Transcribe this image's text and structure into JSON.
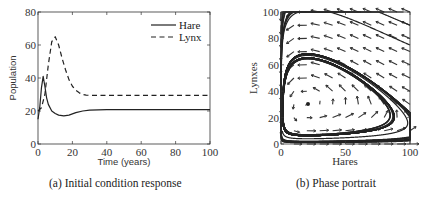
{
  "chart_data": [
    {
      "type": "line",
      "title": "",
      "caption": "(a) Initial condition response",
      "xlabel": "Time (years)",
      "ylabel": "Population",
      "xlim": [
        0,
        100
      ],
      "ylim": [
        0,
        80
      ],
      "xticks": [
        "0",
        "20",
        "40",
        "60",
        "80",
        "100"
      ],
      "yticks": [
        "0",
        "20",
        "40",
        "60",
        "80"
      ],
      "grid": false,
      "legend_position": "upper right",
      "series": [
        {
          "name": "Hare",
          "style": "solid",
          "x": [
            0,
            1,
            2,
            3,
            4,
            5,
            6,
            8,
            10,
            12,
            15,
            18,
            22,
            26,
            30,
            40,
            60,
            80,
            100
          ],
          "values": [
            15,
            22,
            34,
            41,
            35,
            28,
            24,
            20,
            18.5,
            17.5,
            17,
            17.5,
            19,
            20,
            20.5,
            20.8,
            20.8,
            20.8,
            20.8
          ]
        },
        {
          "name": "Lynx",
          "style": "dashed",
          "x": [
            0,
            2,
            4,
            6,
            8,
            10,
            12,
            14,
            16,
            18,
            20,
            22,
            24,
            26,
            28,
            30,
            40,
            60,
            80,
            100
          ],
          "values": [
            20,
            22,
            30,
            48,
            62,
            65,
            60,
            52,
            45,
            39,
            35,
            32.5,
            31,
            30,
            29.6,
            29.5,
            29.5,
            29.5,
            29.5,
            29.5
          ]
        }
      ]
    },
    {
      "type": "scatter",
      "title": "",
      "caption": "(b) Phase portrait",
      "xlabel": "Hares",
      "ylabel": "Lynxes",
      "xlim": [
        0,
        100
      ],
      "ylim": [
        0,
        100
      ],
      "xticks": [
        "0",
        "50",
        "100"
      ],
      "yticks": [
        "0",
        "20",
        "40",
        "60",
        "80",
        "100"
      ],
      "grid": false,
      "equilibrium": [
        21,
        30
      ],
      "description": "Vector field (arrows) with trajectories spiraling into the equilibrium near (21, 30)"
    }
  ]
}
